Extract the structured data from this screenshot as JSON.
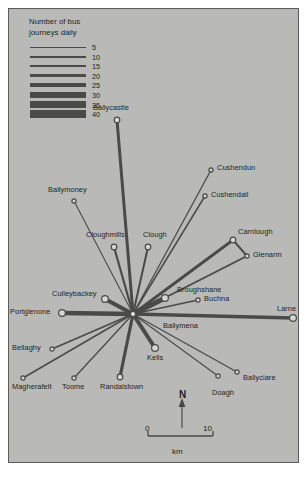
{
  "map": {
    "title": "Bus journeys radiating from Ballymena",
    "background_color": "#b9b9b7",
    "line_color": "#4a4a48",
    "text_color": "#23231f",
    "border_color": "#5c5c5a"
  },
  "legend": {
    "title": "Number of bus\njourneys daily",
    "entries": [
      {
        "value": "5",
        "width": 1.0
      },
      {
        "value": "10",
        "width": 2.0
      },
      {
        "value": "15",
        "width": 2.6
      },
      {
        "value": "20",
        "width": 3.2
      },
      {
        "value": "25",
        "width": 4.2
      },
      {
        "value": "30",
        "width": 5.2
      },
      {
        "value": "35",
        "width": 6.2
      },
      {
        "value": "40",
        "width": 7.4
      }
    ],
    "bar_length": 56
  },
  "hub": {
    "name": "Ballymena",
    "x": 133,
    "y": 314
  },
  "places": [
    {
      "name": "Ballycastle",
      "dot_x": 117,
      "dot_y": 120,
      "label_x": 93,
      "label_y": 104,
      "journeys": 18,
      "line_width": 3.0
    },
    {
      "name": "Cushendun",
      "dot_x": 211,
      "dot_y": 170,
      "label_x": 217,
      "label_y": 164,
      "journeys": 6,
      "line_width": 1.3
    },
    {
      "name": "Cushendall",
      "dot_x": 205,
      "dot_y": 196,
      "label_x": 211,
      "label_y": 191,
      "journeys": 7,
      "line_width": 1.5
    },
    {
      "name": "Ballymoney",
      "dot_x": 74,
      "dot_y": 201,
      "label_x": 48,
      "label_y": 186,
      "journeys": 5,
      "line_width": 1.1
    },
    {
      "name": "Cloughmills",
      "dot_x": 114,
      "dot_y": 247,
      "label_x": 86,
      "label_y": 231,
      "journeys": 11,
      "line_width": 2.2
    },
    {
      "name": "Clough",
      "dot_x": 148,
      "dot_y": 247,
      "label_x": 143,
      "label_y": 231,
      "journeys": 10,
      "line_width": 2.0
    },
    {
      "name": "Carnlough",
      "dot_x": 233,
      "dot_y": 240,
      "label_x": 238,
      "label_y": 228,
      "journeys": 14,
      "line_width": 2.8
    },
    {
      "name": "Glenarm",
      "dot_x": 247,
      "dot_y": 256,
      "label_x": 253,
      "label_y": 251,
      "journeys": 9,
      "line_width": 1.9
    },
    {
      "name": "Culleybackey",
      "dot_x": 105,
      "dot_y": 299,
      "label_x": 52,
      "label_y": 290,
      "journeys": 22,
      "line_width": 4.2
    },
    {
      "name": "Portglenone",
      "dot_x": 62,
      "dot_y": 313,
      "label_x": 10,
      "label_y": 308,
      "journeys": 24,
      "line_width": 4.6
    },
    {
      "name": "Broughshane",
      "dot_x": 165,
      "dot_y": 298,
      "label_x": 177,
      "label_y": 286,
      "journeys": 26,
      "line_width": 5.0
    },
    {
      "name": "Buchna",
      "dot_x": 198,
      "dot_y": 300,
      "label_x": 204,
      "label_y": 295,
      "journeys": 6,
      "line_width": 1.3
    },
    {
      "name": "Larne",
      "dot_x": 293,
      "dot_y": 318,
      "label_x": 277,
      "label_y": 305,
      "journeys": 20,
      "line_width": 3.6
    },
    {
      "name": "Bellaghy",
      "dot_x": 52,
      "dot_y": 349,
      "label_x": 12,
      "label_y": 344,
      "journeys": 8,
      "line_width": 1.7
    },
    {
      "name": "Kells",
      "dot_x": 155,
      "dot_y": 348,
      "label_x": 147,
      "label_y": 354,
      "journeys": 21,
      "line_width": 4.0
    },
    {
      "name": "Magherafelt",
      "dot_x": 23,
      "dot_y": 378,
      "label_x": 12,
      "label_y": 383,
      "journeys": 7,
      "line_width": 1.5
    },
    {
      "name": "Toome",
      "dot_x": 74,
      "dot_y": 378,
      "label_x": 62,
      "label_y": 383,
      "journeys": 6,
      "line_width": 1.3
    },
    {
      "name": "Randalstown",
      "dot_x": 120,
      "dot_y": 377,
      "label_x": 100,
      "label_y": 383,
      "journeys": 16,
      "line_width": 3.2
    },
    {
      "name": "Doagh",
      "dot_x": 218,
      "dot_y": 376,
      "label_x": 212,
      "label_y": 389,
      "journeys": 5,
      "line_width": 1.1
    },
    {
      "name": "Ballyclare",
      "dot_x": 237,
      "dot_y": 372,
      "label_x": 243,
      "label_y": 374,
      "journeys": 6,
      "line_width": 1.3
    }
  ],
  "hub_label": {
    "text": "Ballymena",
    "x": 163,
    "y": 322
  },
  "north_arrow": {
    "letter": "N",
    "x": 182,
    "tip_y": 400,
    "tail_y": 428
  },
  "scale_bar": {
    "min_label": "0",
    "max_label": "10",
    "unit": "km",
    "left_x": 148,
    "right_x": 213,
    "y": 436
  }
}
